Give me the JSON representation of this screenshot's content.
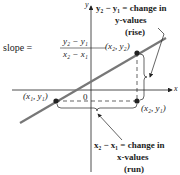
{
  "diagram": {
    "formula": {
      "lhs": "slope =",
      "numerator": "y₂ − y₁",
      "denominator": "x₂ − x₁"
    },
    "axes": {
      "x_label": "x",
      "y_label": "y",
      "origin_label": "0"
    },
    "points": {
      "p1": "(x₁, y₁)",
      "p2": "(x₂, y₂)",
      "p3": "(x₂, y₁)"
    },
    "rise_annotation": {
      "line1": "y₂ − y₁ = change in",
      "line2": "y-values",
      "line3": "(rise)"
    },
    "run_annotation": {
      "line1": "x₂ − x₁ = change in",
      "line2": "x-values",
      "line3": "(run)"
    },
    "colors": {
      "line": "#777777",
      "axis": "#222222",
      "point": "#222222",
      "text": "#222222"
    }
  }
}
